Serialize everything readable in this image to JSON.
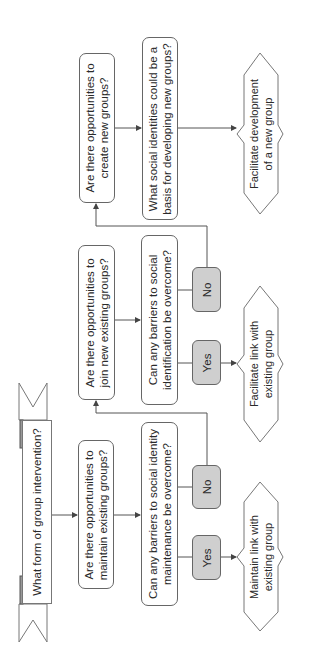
{
  "diagram": {
    "title": "What form of group intervention?",
    "orientation": "rotated-90-ccw",
    "colors": {
      "line": "#555555",
      "box_fill": "#ffffff",
      "choice_fill": "#cfcfcf",
      "border": "#666666"
    },
    "nodes": {
      "start": {
        "label": "What form of group intervention?"
      },
      "maintain_q": {
        "line1": "Are there opportunities to",
        "line2": "maintain existing groups?"
      },
      "maintain_barrier_q": {
        "line1": "Can any barriers to social identity",
        "line2": "maintenance be overcome?"
      },
      "maintain_yes": {
        "label": "Yes"
      },
      "maintain_no": {
        "label": "No"
      },
      "maintain_outcome": {
        "line1": "Maintain link with",
        "line2": "existing group"
      },
      "join_q": {
        "line1": "Are there opportunities to",
        "line2": "join new existing groups?"
      },
      "join_barrier_q": {
        "line1": "Can any barriers to social",
        "line2": "identification be overcome?"
      },
      "join_yes": {
        "label": "Yes"
      },
      "join_no": {
        "label": "No"
      },
      "join_outcome": {
        "line1": "Facilitate link with",
        "line2": "existing group"
      },
      "create_q": {
        "line1": "Are there opportunities to",
        "line2": "create new groups?"
      },
      "create_basis_q": {
        "line1": "What social identities could be a",
        "line2": "basis for developing new groups?"
      },
      "create_outcome": {
        "line1": "Facilitate development",
        "line2": "of a new group"
      }
    }
  }
}
